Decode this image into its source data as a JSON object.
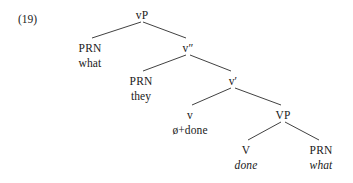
{
  "figure": {
    "example_number": "(19)",
    "type": "syntax-tree",
    "width": 353,
    "height": 183,
    "line_color": "#2b2b2b",
    "text_color": "#1a1a1a",
    "background": "#ffffff"
  },
  "nodes": {
    "root": {
      "label": "vP",
      "terminal": "",
      "italic": false,
      "x": 142,
      "y": 8
    },
    "spec_vp": {
      "label": "PRN",
      "terminal": "what",
      "italic": false,
      "x": 90,
      "y": 41
    },
    "v_double_bar": {
      "label": "v″",
      "terminal": "",
      "italic": false,
      "x": 188,
      "y": 41
    },
    "spec_vbar": {
      "label": "PRN",
      "terminal": "they",
      "italic": false,
      "x": 141,
      "y": 74
    },
    "v_bar": {
      "label": "v′",
      "terminal": "",
      "italic": false,
      "x": 233,
      "y": 74
    },
    "little_v": {
      "label": "v",
      "terminal": "ø+done",
      "italic": false,
      "x": 190,
      "y": 108
    },
    "vp_phrase": {
      "label": "VP",
      "terminal": "",
      "italic": false,
      "x": 283,
      "y": 108
    },
    "verb": {
      "label": "V",
      "terminal": "done",
      "italic": true,
      "x": 246,
      "y": 143
    },
    "object": {
      "label": "PRN",
      "terminal": "what",
      "italic": true,
      "x": 321,
      "y": 143
    }
  },
  "branches": [
    {
      "name": "vp-to-spec-vp",
      "x1": 141,
      "y1": 22,
      "x2": 92,
      "y2": 38
    },
    {
      "name": "vp-to-v-double-bar",
      "x1": 143,
      "y1": 22,
      "x2": 186,
      "y2": 38
    },
    {
      "name": "v2-to-spec-vbar",
      "x1": 186,
      "y1": 55,
      "x2": 143,
      "y2": 71
    },
    {
      "name": "v2-to-v-bar",
      "x1": 190,
      "y1": 55,
      "x2": 231,
      "y2": 71
    },
    {
      "name": "vbar-to-little-v",
      "x1": 231,
      "y1": 88,
      "x2": 192,
      "y2": 105
    },
    {
      "name": "vbar-to-vp",
      "x1": 235,
      "y1": 88,
      "x2": 281,
      "y2": 105
    },
    {
      "name": "vp-to-verb",
      "x1": 281,
      "y1": 122,
      "x2": 248,
      "y2": 140
    },
    {
      "name": "vp-to-object",
      "x1": 285,
      "y1": 122,
      "x2": 319,
      "y2": 140
    }
  ]
}
